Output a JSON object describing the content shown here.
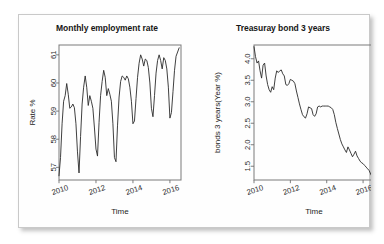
{
  "figure": {
    "background_color": "#ffffff",
    "card_color": "#fefefe",
    "line_color": "#2a2a2a",
    "axis_color": "#7a7a7a"
  },
  "chart_data": [
    {
      "type": "line",
      "panel": "left",
      "title": "Monthly employment rate",
      "xlabel": "Time",
      "ylabel": "Rate %",
      "xlim": [
        2010.0,
        2016.6
      ],
      "ylim": [
        56.55,
        61.35
      ],
      "xticks": [
        2010,
        2012,
        2014,
        2016
      ],
      "xticklabels": [
        "2010",
        "2012",
        "2014",
        "2016"
      ],
      "yticks": [
        57,
        58,
        59,
        60,
        61
      ],
      "yticklabels": [
        "57",
        "58",
        "59",
        "60",
        "61"
      ],
      "grid": false,
      "legend": "none",
      "x": [
        2010.0,
        2010.083,
        2010.167,
        2010.25,
        2010.333,
        2010.417,
        2010.5,
        2010.583,
        2010.667,
        2010.75,
        2010.833,
        2010.917,
        2011.0,
        2011.083,
        2011.167,
        2011.25,
        2011.333,
        2011.417,
        2011.5,
        2011.583,
        2011.667,
        2011.75,
        2011.833,
        2011.917,
        2012.0,
        2012.083,
        2012.167,
        2012.25,
        2012.333,
        2012.417,
        2012.5,
        2012.583,
        2012.667,
        2012.75,
        2012.833,
        2012.917,
        2013.0,
        2013.083,
        2013.167,
        2013.25,
        2013.333,
        2013.417,
        2013.5,
        2013.583,
        2013.667,
        2013.75,
        2013.833,
        2013.917,
        2014.0,
        2014.083,
        2014.167,
        2014.25,
        2014.333,
        2014.417,
        2014.5,
        2014.583,
        2014.667,
        2014.75,
        2014.833,
        2014.917,
        2015.0,
        2015.083,
        2015.167,
        2015.25,
        2015.333,
        2015.417,
        2015.5,
        2015.583,
        2015.667,
        2015.75,
        2015.833,
        2015.917,
        2016.0,
        2016.083,
        2016.167,
        2016.25,
        2016.333,
        2016.417,
        2016.5
      ],
      "values": [
        56.7,
        57.35,
        58.55,
        59.35,
        59.55,
        59.98,
        59.6,
        59.1,
        59.15,
        59.25,
        59.12,
        58.55,
        57.55,
        56.8,
        58.1,
        59.25,
        59.85,
        60.25,
        59.85,
        59.2,
        59.55,
        59.35,
        59.1,
        58.4,
        57.65,
        57.4,
        58.6,
        59.55,
        60.05,
        60.45,
        60.2,
        59.55,
        59.8,
        59.6,
        59.35,
        58.55,
        57.35,
        57.2,
        58.5,
        59.5,
        60.05,
        60.25,
        60.2,
        60.1,
        60.25,
        60.15,
        59.85,
        59.35,
        58.55,
        58.65,
        59.45,
        60.2,
        60.7,
        61.0,
        60.85,
        60.6,
        60.85,
        60.8,
        60.55,
        60.0,
        59.1,
        58.8,
        59.55,
        60.35,
        60.8,
        61.0,
        60.8,
        60.5,
        60.9,
        60.8,
        60.5,
        59.85,
        58.75,
        58.95,
        59.7,
        60.45,
        60.95,
        61.1,
        61.25
      ]
    },
    {
      "type": "line",
      "panel": "right",
      "title": "Treasuray bond 3 years",
      "xlabel": "Time",
      "ylabel": "bonds 3 years(Year %)",
      "xlim": [
        2010.0,
        2016.6
      ],
      "ylim": [
        1.18,
        4.32
      ],
      "xticks": [
        2010,
        2012,
        2014,
        2016
      ],
      "xticklabels": [
        "2010",
        "2012",
        "2014",
        "2016"
      ],
      "yticks": [
        1.5,
        2.0,
        2.5,
        3.0,
        3.5,
        4.0
      ],
      "yticklabels": [
        "1.5",
        "2.0",
        "2.5",
        "3.0",
        "3.5",
        "4.0"
      ],
      "grid": false,
      "legend": "none",
      "x": [
        2010.0,
        2010.083,
        2010.167,
        2010.25,
        2010.333,
        2010.417,
        2010.5,
        2010.583,
        2010.667,
        2010.75,
        2010.833,
        2010.917,
        2011.0,
        2011.083,
        2011.167,
        2011.25,
        2011.333,
        2011.417,
        2011.5,
        2011.583,
        2011.667,
        2011.75,
        2011.833,
        2011.917,
        2012.0,
        2012.083,
        2012.167,
        2012.25,
        2012.333,
        2012.417,
        2012.5,
        2012.583,
        2012.667,
        2012.75,
        2012.833,
        2012.917,
        2013.0,
        2013.083,
        2013.167,
        2013.25,
        2013.333,
        2013.417,
        2013.5,
        2013.583,
        2013.667,
        2013.75,
        2013.833,
        2013.917,
        2014.0,
        2014.083,
        2014.167,
        2014.25,
        2014.333,
        2014.417,
        2014.5,
        2014.583,
        2014.667,
        2014.75,
        2014.833,
        2014.917,
        2015.0,
        2015.083,
        2015.167,
        2015.25,
        2015.333,
        2015.417,
        2015.5,
        2015.583,
        2015.667,
        2015.75,
        2015.833,
        2015.917,
        2016.0,
        2016.083,
        2016.167,
        2016.25,
        2016.333,
        2016.417,
        2016.5
      ],
      "values": [
        4.28,
        4.05,
        3.9,
        3.95,
        3.72,
        3.55,
        3.85,
        3.9,
        3.6,
        3.4,
        3.28,
        3.22,
        3.35,
        3.28,
        3.55,
        3.72,
        3.68,
        3.72,
        3.74,
        3.65,
        3.6,
        3.4,
        3.38,
        3.42,
        3.52,
        3.5,
        3.48,
        3.42,
        3.25,
        3.1,
        2.95,
        2.82,
        2.7,
        2.65,
        2.62,
        2.72,
        2.88,
        2.86,
        2.84,
        2.7,
        2.66,
        2.72,
        2.88,
        2.9,
        2.88,
        2.9,
        2.9,
        2.9,
        2.9,
        2.9,
        2.88,
        2.86,
        2.82,
        2.7,
        2.52,
        2.38,
        2.25,
        2.12,
        2.02,
        1.95,
        1.88,
        1.82,
        1.95,
        1.88,
        1.8,
        1.72,
        1.78,
        1.85,
        1.74,
        1.68,
        1.62,
        1.58,
        1.56,
        1.52,
        1.48,
        1.44,
        1.4,
        1.32,
        1.25
      ]
    }
  ]
}
